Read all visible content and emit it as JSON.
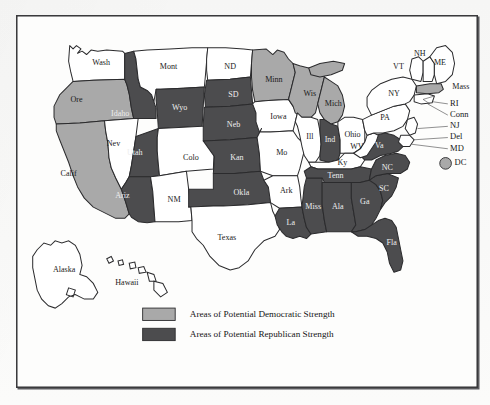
{
  "document": {
    "type": "united-states-political-map",
    "title": "",
    "background_color": "#f7f7f6",
    "frame_color": "#3a3a3c",
    "map_background": "#fdfdfc"
  },
  "colors": {
    "democratic_fill": "#a9a9a9",
    "republican_fill": "#4c4c4e",
    "neutral_fill": "#ffffff",
    "outline": "#2b2b2d",
    "label_text": "#151515"
  },
  "legend": {
    "items": [
      {
        "swatch_color": "#a9a9a9",
        "label": "Areas of Potential Democratic Strength"
      },
      {
        "swatch_color": "#4c4c4e",
        "label": "Areas of Potential Republican Strength"
      }
    ]
  },
  "map": {
    "categories": {
      "democratic": "Areas of Potential Democratic Strength",
      "republican": "Areas of Potential Republican Strength",
      "neutral": "No shading"
    },
    "states": [
      {
        "label": "Wash",
        "category": "neutral",
        "lx": 325,
        "ly": 112
      },
      {
        "label": "Ore",
        "category": "democratic",
        "lx": 303,
        "ly": 145
      },
      {
        "label": "Calif",
        "category": "democratic",
        "lx": 296,
        "ly": 211
      },
      {
        "label": "Nev",
        "category": "neutral",
        "lx": 336,
        "ly": 184
      },
      {
        "label": "Idaho",
        "category": "republican",
        "lx": 342,
        "ly": 157
      },
      {
        "label": "Mont",
        "category": "neutral",
        "lx": 385,
        "ly": 115
      },
      {
        "label": "Wyo",
        "category": "republican",
        "lx": 395,
        "ly": 152
      },
      {
        "label": "Utah",
        "category": "republican",
        "lx": 355,
        "ly": 192
      },
      {
        "label": "Colo",
        "category": "neutral",
        "lx": 405,
        "ly": 196
      },
      {
        "label": "Ariz",
        "category": "republican",
        "lx": 344,
        "ly": 230
      },
      {
        "label": "NM",
        "category": "neutral",
        "lx": 390,
        "ly": 234
      },
      {
        "label": "ND",
        "category": "neutral",
        "lx": 440,
        "ly": 115
      },
      {
        "label": "SD",
        "category": "republican",
        "lx": 443,
        "ly": 144
      },
      {
        "label": "Neb",
        "category": "republican",
        "lx": 446,
        "ly": 170
      },
      {
        "label": "Kan",
        "category": "republican",
        "lx": 450,
        "ly": 196
      },
      {
        "label": "Okla",
        "category": "republican",
        "lx": 453,
        "ly": 230
      },
      {
        "label": "Texas",
        "category": "neutral",
        "lx": 434,
        "ly": 268
      },
      {
        "label": "Minn",
        "category": "democratic",
        "lx": 482,
        "ly": 127
      },
      {
        "label": "Iowa",
        "category": "neutral",
        "lx": 487,
        "ly": 160
      },
      {
        "label": "Mo",
        "category": "neutral",
        "lx": 490,
        "ly": 190
      },
      {
        "label": "Ark",
        "category": "neutral",
        "lx": 495,
        "ly": 222
      },
      {
        "label": "La",
        "category": "republican",
        "lx": 498,
        "ly": 252
      },
      {
        "label": "Wis",
        "category": "democratic",
        "lx": 513,
        "ly": 139
      },
      {
        "label": "Ill",
        "category": "neutral",
        "lx": 512,
        "ly": 176
      },
      {
        "label": "Miss",
        "category": "republican",
        "lx": 517,
        "ly": 240
      },
      {
        "label": "Mich",
        "category": "democratic",
        "lx": 532,
        "ly": 150
      },
      {
        "label": "Ind",
        "category": "republican",
        "lx": 531,
        "ly": 177
      },
      {
        "label": "Ohio",
        "category": "neutral",
        "lx": 549,
        "ly": 172
      },
      {
        "label": "Ky",
        "category": "neutral",
        "lx": 544,
        "ly": 195
      },
      {
        "label": "Tenn",
        "category": "republican",
        "lx": 542,
        "ly": 215
      },
      {
        "label": "Ala",
        "category": "republican",
        "lx": 539,
        "ly": 240
      },
      {
        "label": "Ga",
        "category": "republican",
        "lx": 561,
        "ly": 236
      },
      {
        "label": "Fla",
        "category": "republican",
        "lx": 586,
        "ly": 268
      },
      {
        "label": "SC",
        "category": "republican",
        "lx": 578,
        "ly": 222
      },
      {
        "label": "NC",
        "category": "republican",
        "lx": 580,
        "ly": 205
      },
      {
        "label": "Va",
        "category": "republican",
        "lx": 572,
        "ly": 186
      },
      {
        "label": "WV",
        "category": "neutral",
        "lx": 553,
        "ly": 187
      },
      {
        "label": "PA",
        "category": "neutral",
        "lx": 578,
        "ly": 159
      },
      {
        "label": "NY",
        "category": "neutral",
        "lx": 587,
        "ly": 139
      },
      {
        "label": "VT",
        "category": "neutral",
        "lx": 592,
        "ly": 115
      },
      {
        "label": "NH",
        "category": "neutral",
        "lx": 608,
        "ly": 106
      },
      {
        "label": "ME",
        "category": "neutral",
        "lx": 622,
        "ly": 114
      },
      {
        "label": "Mass",
        "category": "neutral",
        "lx": 629,
        "ly": 131
      },
      {
        "label": "Alaska",
        "category": "neutral",
        "lx": 290,
        "ly": 295
      },
      {
        "label": "Hawaii",
        "category": "neutral",
        "lx": 345,
        "ly": 303
      }
    ],
    "northeast_labels": [
      {
        "label": "RI"
      },
      {
        "label": "Conn"
      },
      {
        "label": "NJ"
      },
      {
        "label": "Del"
      },
      {
        "label": "MD"
      }
    ],
    "dc": {
      "label": "DC",
      "marker_color": "#a9a9a9"
    }
  }
}
